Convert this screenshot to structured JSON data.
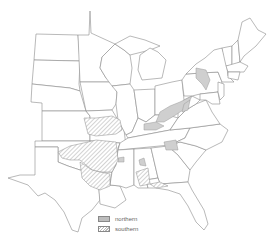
{
  "map": {
    "region": "Eastern United States",
    "colors": {
      "northern": "#c8c8c8",
      "southern_hatch": "#b0b0b0",
      "border": "#8a8a8a"
    }
  },
  "legend": {
    "items": [
      {
        "label": "northern",
        "style": "solid-gray"
      },
      {
        "label": "southern",
        "style": "hatched"
      }
    ]
  }
}
